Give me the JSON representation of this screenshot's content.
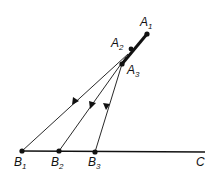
{
  "diagram": {
    "points": {
      "A1": {
        "label": "A",
        "sub": "1",
        "x": 147,
        "y": 34
      },
      "A2": {
        "label": "A",
        "sub": "2",
        "x": 131,
        "y": 49
      },
      "A3": {
        "label": "A",
        "sub": "3",
        "x": 122,
        "y": 64
      },
      "B1": {
        "label": "B",
        "sub": "1",
        "x": 22,
        "y": 151
      },
      "B2": {
        "label": "B",
        "sub": "2",
        "x": 59,
        "y": 151
      },
      "B3": {
        "label": "B",
        "sub": "3",
        "x": 95,
        "y": 152
      },
      "C": {
        "label": "C",
        "x": 205,
        "y": 152
      }
    },
    "lines": [
      {
        "from": "A1",
        "to": "A3",
        "style": "thick"
      },
      {
        "from": "B1",
        "to": "C",
        "style": "medium"
      },
      {
        "from": "A2",
        "to": "B1",
        "style": "thin",
        "arrow": true
      },
      {
        "from": "A2",
        "to": "B2",
        "style": "thin",
        "arrow": true
      },
      {
        "from": "A3",
        "to": "B3",
        "style": "thin",
        "arrow": true
      }
    ],
    "color": "#111111"
  }
}
